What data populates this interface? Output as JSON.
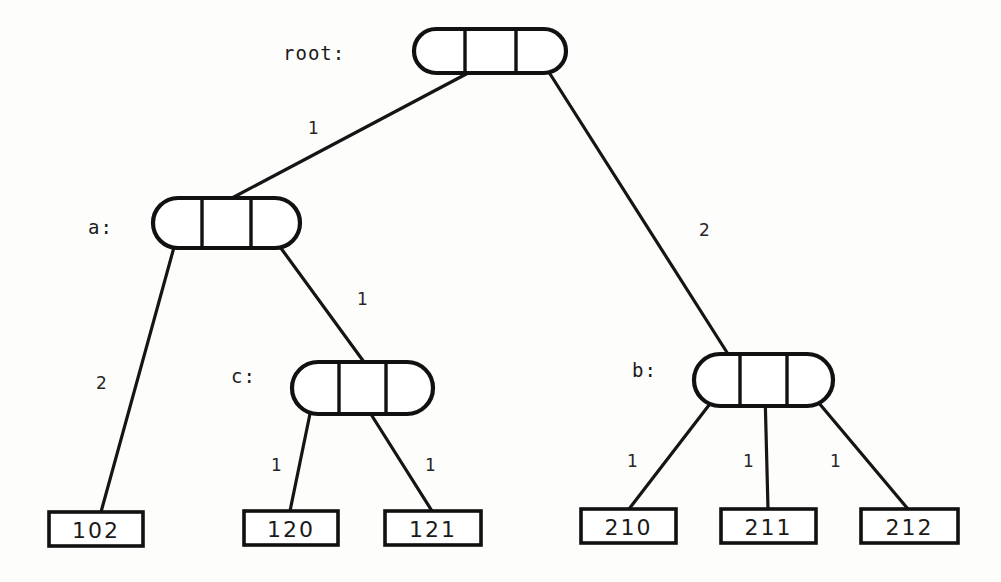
{
  "diagram": {
    "type": "trie-tree",
    "nodes": [
      {
        "id": "root",
        "label": "root:",
        "shape": "capsule",
        "cells": 3,
        "label_x": 283,
        "label_y": 54,
        "box": {
          "x": 414,
          "y": 29,
          "w": 152,
          "h": 44
        }
      },
      {
        "id": "a",
        "label": "a:",
        "shape": "capsule",
        "cells": 3,
        "label_x": 88,
        "label_y": 228,
        "box": {
          "x": 153,
          "y": 198,
          "w": 147,
          "h": 50
        }
      },
      {
        "id": "c",
        "label": "c:",
        "shape": "capsule",
        "cells": 3,
        "label_x": 231,
        "label_y": 377,
        "box": {
          "x": 292,
          "y": 362,
          "w": 141,
          "h": 52
        }
      },
      {
        "id": "b",
        "label": "b:",
        "shape": "capsule",
        "cells": 3,
        "label_x": 632,
        "label_y": 371,
        "box": {
          "x": 694,
          "y": 354,
          "w": 139,
          "h": 52
        }
      }
    ],
    "leaves": [
      {
        "id": "leaf-102",
        "value": "102",
        "box": {
          "x": 49,
          "y": 512,
          "w": 94,
          "h": 34
        }
      },
      {
        "id": "leaf-120",
        "value": "120",
        "box": {
          "x": 244,
          "y": 511,
          "w": 94,
          "h": 34
        }
      },
      {
        "id": "leaf-121",
        "value": "121",
        "box": {
          "x": 385,
          "y": 511,
          "w": 96,
          "h": 34
        }
      },
      {
        "id": "leaf-210",
        "value": "210",
        "box": {
          "x": 581,
          "y": 509,
          "w": 95,
          "h": 34
        }
      },
      {
        "id": "leaf-211",
        "value": "211",
        "box": {
          "x": 721,
          "y": 509,
          "w": 95,
          "h": 34
        }
      },
      {
        "id": "leaf-212",
        "value": "212",
        "box": {
          "x": 861,
          "y": 509,
          "w": 97,
          "h": 34
        }
      }
    ],
    "edges": [
      {
        "id": "edge-root-a",
        "from": "root",
        "from_cell": 1,
        "to": "a",
        "label": "1",
        "label_x": 308,
        "label_y": 120,
        "x1": 470,
        "y1": 72,
        "x2": 232,
        "y2": 198
      },
      {
        "id": "edge-root-b",
        "from": "root",
        "from_cell": 3,
        "to": "b",
        "label": "2",
        "label_x": 699,
        "label_y": 222,
        "x1": 545,
        "y1": 66,
        "x2": 728,
        "y2": 354
      },
      {
        "id": "edge-a-102",
        "from": "a",
        "from_cell": 1,
        "to": "leaf-102",
        "label": "2",
        "label_x": 96,
        "label_y": 375,
        "x1": 176,
        "y1": 240,
        "x2": 101,
        "y2": 512
      },
      {
        "id": "edge-a-c",
        "from": "a",
        "from_cell": 3,
        "to": "c",
        "label": "1",
        "label_x": 357,
        "label_y": 291,
        "x1": 275,
        "y1": 240,
        "x2": 364,
        "y2": 362
      },
      {
        "id": "edge-c-120",
        "from": "c",
        "from_cell": 1,
        "to": "leaf-120",
        "label": "1",
        "label_x": 271,
        "label_y": 457,
        "x1": 312,
        "y1": 404,
        "x2": 290,
        "y2": 511
      },
      {
        "id": "edge-c-121",
        "from": "c",
        "from_cell": 2,
        "to": "leaf-121",
        "label": "1",
        "label_x": 425,
        "label_y": 457,
        "x1": 362,
        "y1": 400,
        "x2": 432,
        "y2": 511
      },
      {
        "id": "edge-b-210",
        "from": "b",
        "from_cell": 1,
        "to": "leaf-210",
        "label": "1",
        "label_x": 627,
        "label_y": 453,
        "x1": 716,
        "y1": 396,
        "x2": 629,
        "y2": 509
      },
      {
        "id": "edge-b-211",
        "from": "b",
        "from_cell": 2,
        "to": "leaf-211",
        "label": "1",
        "label_x": 743,
        "label_y": 453,
        "x1": 765,
        "y1": 392,
        "x2": 768,
        "y2": 509
      },
      {
        "id": "edge-b-212",
        "from": "b",
        "from_cell": 3,
        "to": "leaf-212",
        "label": "1",
        "label_x": 830,
        "label_y": 453,
        "x1": 813,
        "y1": 396,
        "x2": 908,
        "y2": 509
      }
    ],
    "colors": {
      "background": "#fdfdfc",
      "stroke": "#111111",
      "text": "#1a1a1a",
      "edge": "#151515"
    }
  }
}
